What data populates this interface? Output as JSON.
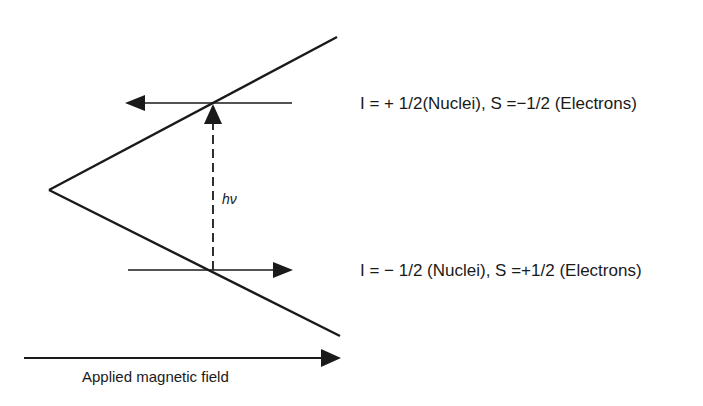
{
  "diagram": {
    "upper_level_label": "I = + 1/2(Nuclei), S =−1/2 (Electrons)",
    "lower_level_label": "I = − 1/2 (Nuclei), S =+1/2 (Electrons)",
    "transition_label": "hν",
    "field_axis_label": "Applied magnetic field",
    "colors": {
      "ink": "#1a1a1a",
      "background": "#ffffff"
    }
  }
}
